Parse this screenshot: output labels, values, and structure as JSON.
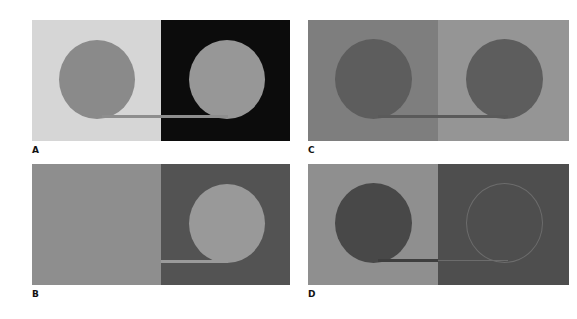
{
  "figure": {
    "panels": [
      {
        "id": "A",
        "label": "A",
        "left_bg": "#d6d6d6",
        "right_bg": "#0c0c0c",
        "left_circle": "#8a8a8a",
        "right_circle": "#979797",
        "bar": "#8e8e8e"
      },
      {
        "id": "B",
        "label": "B",
        "left_bg": "#8e8e8e",
        "right_bg": "#535353",
        "left_circle": null,
        "right_circle": "#999999",
        "bar": "#9a9a9a"
      },
      {
        "id": "C",
        "label": "C",
        "left_bg": "#7e7e7e",
        "right_bg": "#959595",
        "left_circle": "#5d5d5d",
        "right_circle": "#5d5d5d",
        "bar": "#5a5a5a"
      },
      {
        "id": "D",
        "label": "D",
        "left_bg": "#8f8f8f",
        "right_bg": "#4e4e4e",
        "left_circle": "#484848",
        "right_circle": "outline",
        "bar": "#3e3e3e"
      }
    ]
  }
}
